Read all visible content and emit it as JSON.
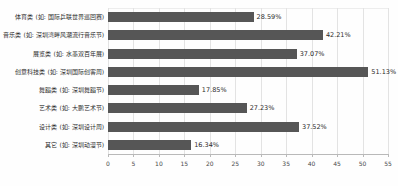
{
  "chart_data": {
    "type": "bar",
    "orientation": "horizontal",
    "title": "",
    "xlabel": "",
    "ylabel": "",
    "xlim": [
      0,
      55
    ],
    "xticks": [
      0,
      5,
      10,
      15,
      20,
      25,
      30,
      35,
      40,
      45,
      50,
      55
    ],
    "grid": true,
    "legend": false,
    "bar_color": "#565656",
    "categories": [
      "体育类 (如: 国际乒联世界巡回赛)",
      "音乐类 (如: 深圳湾畔风潮流行音乐节)",
      "展览类 (如: 水墨双百年展)",
      "创意科技类 (如: 深圳国际创客周)",
      "舞蹈类 (如: 深圳舞蹈节)",
      "艺术类 (如: 大鹏艺术节)",
      "设计类 (如: 深圳设计周)",
      "其它 (如: 深圳动漫节)"
    ],
    "values": [
      28.59,
      42.21,
      37.07,
      51.13,
      17.85,
      27.23,
      37.52,
      16.34
    ],
    "value_labels": [
      "28.59%",
      "42.21%",
      "37.07%",
      "51.13%",
      "17.85%",
      "27.23%",
      "37.52%",
      "16.34%"
    ]
  }
}
